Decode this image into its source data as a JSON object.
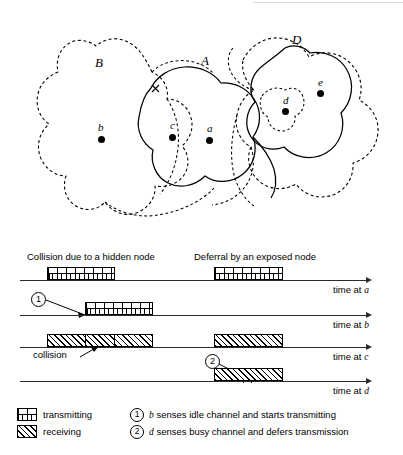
{
  "figure": {
    "top_panel": {
      "regions": [
        {
          "name": "B",
          "style": "dashed",
          "label": "B"
        },
        {
          "name": "A",
          "style": "solid",
          "label": "A"
        },
        {
          "name": "D",
          "style": "dashed",
          "label": "D"
        }
      ],
      "nodes": [
        {
          "id": "b",
          "label": "b"
        },
        {
          "id": "c",
          "label": "c"
        },
        {
          "id": "a",
          "label": "a"
        },
        {
          "id": "d",
          "label": "d"
        },
        {
          "id": "e",
          "label": "e"
        }
      ],
      "marks": [
        {
          "id": "x-mark",
          "label": "x"
        }
      ]
    },
    "timing_panel": {
      "section_titles": {
        "left": "Collision due to a hidden node",
        "right": "Deferral by an exposed node"
      },
      "axes": [
        {
          "id": "a",
          "label_prefix": "time at ",
          "label_node": "a"
        },
        {
          "id": "b",
          "label_prefix": "time at ",
          "label_node": "b"
        },
        {
          "id": "c",
          "label_prefix": "time at ",
          "label_node": "c"
        },
        {
          "id": "d",
          "label_prefix": "time at ",
          "label_node": "d"
        }
      ],
      "bars": [
        {
          "row": "a",
          "kind": "transmitting",
          "start": 47,
          "end": 115
        },
        {
          "row": "a",
          "kind": "transmitting",
          "start": 214,
          "end": 283
        },
        {
          "row": "b",
          "kind": "transmitting",
          "start": 85,
          "end": 153
        },
        {
          "row": "c",
          "kind": "receiving",
          "start": 47,
          "end": 153
        },
        {
          "row": "c",
          "kind": "collision",
          "start": 85,
          "end": 115
        },
        {
          "row": "c",
          "kind": "receiving",
          "start": 214,
          "end": 283
        },
        {
          "row": "d",
          "kind": "receiving",
          "start": 214,
          "end": 283
        }
      ],
      "callouts": [
        {
          "id": "1",
          "symbol": "1"
        },
        {
          "id": "2",
          "symbol": "2"
        }
      ],
      "annotations": [
        {
          "id": "collision",
          "text": "collision"
        }
      ]
    },
    "legend": {
      "patterns": [
        {
          "key": "transmitting",
          "label": "transmitting"
        },
        {
          "key": "receiving",
          "label": "receiving"
        }
      ],
      "notes": [
        {
          "num": "1",
          "node": "b",
          "text": " senses idle channel and starts transmitting"
        },
        {
          "num": "2",
          "node": "d",
          "text": " senses busy channel and defers transmission"
        }
      ]
    }
  }
}
